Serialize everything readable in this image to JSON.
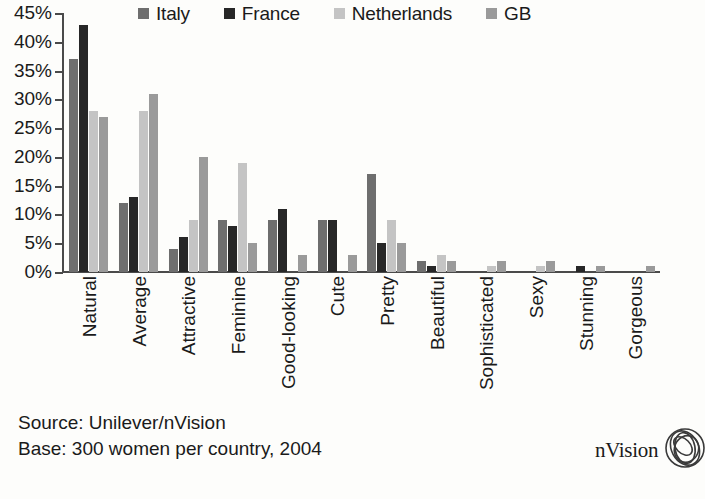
{
  "chart_data": {
    "type": "bar",
    "title": "",
    "xlabel": "",
    "ylabel": "",
    "ylim": [
      0,
      45
    ],
    "ytick_labels": [
      "45%",
      "40%",
      "35%",
      "30%",
      "25%",
      "20%",
      "15%",
      "10%",
      "5%",
      "0%"
    ],
    "ytick_values": [
      45,
      40,
      35,
      30,
      25,
      20,
      15,
      10,
      5,
      0
    ],
    "grid": false,
    "legend_position": "top",
    "categories": [
      "Natural",
      "Average",
      "Attractive",
      "Feminine",
      "Good-looking",
      "Cute",
      "Pretty",
      "Beautiful",
      "Sophisticated",
      "Sexy",
      "Stunning",
      "Gorgeous"
    ],
    "series": [
      {
        "name": "Italy",
        "color": "#6e6e6e",
        "values": [
          37,
          12,
          4,
          9,
          9,
          9,
          17,
          2,
          0,
          0,
          0,
          0
        ]
      },
      {
        "name": "France",
        "color": "#272727",
        "values": [
          43,
          13,
          6,
          8,
          11,
          9,
          5,
          1,
          0,
          0,
          1,
          0
        ]
      },
      {
        "name": "Netherlands",
        "color": "#c4c4c4",
        "values": [
          28,
          28,
          9,
          19,
          0,
          0,
          9,
          3,
          1,
          1,
          0,
          0
        ]
      },
      {
        "name": "GB",
        "color": "#9a9a9a",
        "values": [
          27,
          31,
          20,
          5,
          3,
          3,
          5,
          2,
          2,
          2,
          1,
          1
        ]
      }
    ]
  },
  "legend": {
    "items": [
      {
        "label": "Italy",
        "color": "#6e6e6e"
      },
      {
        "label": "France",
        "color": "#272727"
      },
      {
        "label": "Netherlands",
        "color": "#c4c4c4"
      },
      {
        "label": "GB",
        "color": "#9a9a9a"
      }
    ]
  },
  "footer": {
    "source_line": "Source: Unilever/nVision",
    "base_line": "Base: 300 women per country, 2004"
  },
  "brand": {
    "name": "nVision",
    "mark_icon": "overlapping-circles-logo-icon"
  }
}
